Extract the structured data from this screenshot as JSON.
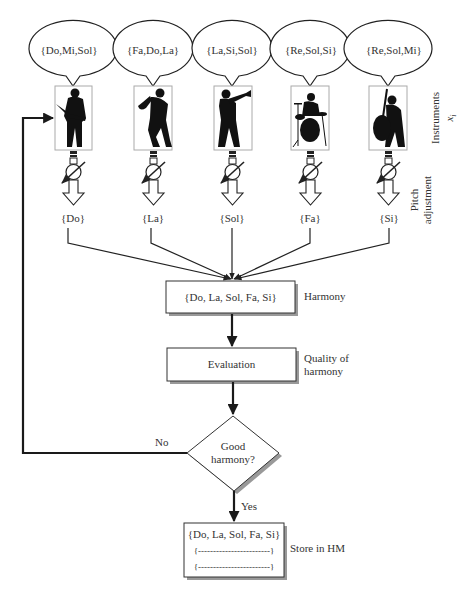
{
  "musicians": [
    {
      "id": "guitarist",
      "notes": "{Do,Mi,Sol}",
      "selected": "{Do}",
      "cx": 73
    },
    {
      "id": "saxophonist",
      "notes": "{Fa,Do,La}",
      "selected": "{La}",
      "cx": 153
    },
    {
      "id": "trumpeter",
      "notes": "{La,Si,Sol}",
      "selected": "{Sol}",
      "cx": 232
    },
    {
      "id": "drummer",
      "notes": "{Re,Sol,Si}",
      "selected": "{Fa}",
      "cx": 310
    },
    {
      "id": "bassist",
      "notes": "{Re,Sol,Mi}",
      "selected": "{Si}",
      "cx": 389
    }
  ],
  "side_labels": {
    "instruments": "Instruments",
    "instruments_var": "x",
    "instruments_sub": "i",
    "pitch_line1": "Pitch",
    "pitch_line2": "adjustment",
    "harmony": "Harmony",
    "quality_line1": "Quality of",
    "quality_line2": "harmony",
    "store": "Store in HM"
  },
  "nodes": {
    "harmony_box": "{Do, La, Sol, Fa, Si}",
    "evaluation_box": "Evaluation",
    "decision_line1": "Good",
    "decision_line2": "harmony?",
    "hm_row1": "{Do, La, Sol, Fa, Si}",
    "hm_row2": "{------------------------}",
    "hm_row3": "{------------------------}"
  },
  "edges": {
    "no_label": "No",
    "yes_label": "Yes"
  }
}
